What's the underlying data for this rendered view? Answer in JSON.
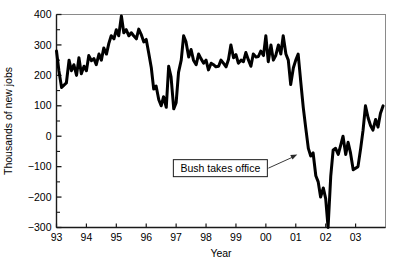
{
  "chart_data": {
    "type": "line",
    "title": "",
    "xlabel": "Year",
    "ylabel": "Thousands of new jobs",
    "xlim": [
      1993.0,
      2004.0
    ],
    "ylim": [
      -300,
      400
    ],
    "grid": false,
    "legend": "none",
    "xtick_labels": [
      "93",
      "94",
      "95",
      "96",
      "97",
      "98",
      "99",
      "00",
      "01",
      "02",
      "03"
    ],
    "xtick_values": [
      1993,
      1994,
      1995,
      1996,
      1997,
      1998,
      1999,
      2000,
      2001,
      2002,
      2003
    ],
    "ytick_labels": [
      "400",
      "300",
      "200",
      "100",
      "0",
      "-100",
      "-200",
      "-300"
    ],
    "ytick_values": [
      400,
      300,
      200,
      100,
      0,
      -100,
      -200,
      -300
    ],
    "yminor_step": 50,
    "line_color": "#000000",
    "line_width": 3,
    "annotations": [
      {
        "text": "Bush takes office",
        "box_x": 2000.05,
        "box_y": -105,
        "arrow_tip_x": 2001.05,
        "arrow_tip_y": -60
      }
    ],
    "series": [
      {
        "name": "Monthly change in nonfarm payroll employment",
        "x": [
          1993.0,
          1993.08,
          1993.17,
          1993.25,
          1993.33,
          1993.42,
          1993.5,
          1993.58,
          1993.67,
          1993.75,
          1993.83,
          1993.92,
          1994.0,
          1994.08,
          1994.17,
          1994.25,
          1994.33,
          1994.42,
          1994.5,
          1994.58,
          1994.67,
          1994.75,
          1994.83,
          1994.92,
          1995.0,
          1995.08,
          1995.17,
          1995.25,
          1995.33,
          1995.42,
          1995.5,
          1995.58,
          1995.67,
          1995.75,
          1995.83,
          1995.92,
          1996.0,
          1996.08,
          1996.17,
          1996.25,
          1996.33,
          1996.42,
          1996.5,
          1996.58,
          1996.67,
          1996.75,
          1996.83,
          1996.92,
          1997.0,
          1997.08,
          1997.17,
          1997.25,
          1997.33,
          1997.42,
          1997.5,
          1997.58,
          1997.67,
          1997.75,
          1997.83,
          1997.92,
          1998.0,
          1998.08,
          1998.17,
          1998.25,
          1998.33,
          1998.42,
          1998.5,
          1998.58,
          1998.67,
          1998.75,
          1998.83,
          1998.92,
          1999.0,
          1999.08,
          1999.17,
          1999.25,
          1999.33,
          1999.42,
          1999.5,
          1999.58,
          1999.67,
          1999.75,
          1999.83,
          1999.92,
          2000.0,
          2000.08,
          2000.17,
          2000.25,
          2000.33,
          2000.42,
          2000.5,
          2000.58,
          2000.67,
          2000.75,
          2000.83,
          2000.92,
          2001.0,
          2001.08,
          2001.17,
          2001.25,
          2001.33,
          2001.42,
          2001.5,
          2001.58,
          2001.67,
          2001.75,
          2001.83,
          2001.92,
          2002.0,
          2002.08,
          2002.17,
          2002.25,
          2002.33,
          2002.42,
          2002.5,
          2002.58,
          2002.67,
          2002.75,
          2002.83,
          2002.92,
          2003.0,
          2003.08,
          2003.17,
          2003.25,
          2003.33,
          2003.42,
          2003.5,
          2003.58,
          2003.67,
          2003.75,
          2003.83,
          2003.92
        ],
        "values": [
          280,
          215,
          160,
          168,
          175,
          250,
          215,
          235,
          200,
          258,
          205,
          230,
          215,
          265,
          248,
          255,
          235,
          270,
          250,
          290,
          270,
          305,
          330,
          320,
          350,
          330,
          395,
          340,
          350,
          330,
          340,
          330,
          320,
          352,
          335,
          310,
          318,
          275,
          225,
          155,
          165,
          120,
          100,
          130,
          95,
          230,
          195,
          90,
          110,
          210,
          250,
          330,
          310,
          260,
          285,
          250,
          235,
          270,
          255,
          240,
          250,
          218,
          240,
          235,
          228,
          230,
          250,
          240,
          228,
          252,
          300,
          258,
          268,
          240,
          250,
          245,
          275,
          250,
          230,
          270,
          260,
          262,
          280,
          265,
          330,
          245,
          300,
          250,
          265,
          300,
          270,
          330,
          270,
          250,
          170,
          225,
          250,
          270,
          175,
          95,
          30,
          -40,
          -65,
          -55,
          -130,
          -150,
          -200,
          -170,
          -205,
          -300,
          -130,
          -45,
          -40,
          -60,
          -30,
          0,
          -60,
          -20,
          -55,
          -110,
          -105,
          -100,
          -40,
          20,
          100,
          60,
          35,
          20,
          55,
          30,
          75,
          100
        ]
      }
    ]
  },
  "axis_labels": {
    "y_title": "Thousands of new jobs",
    "x_title": "Year"
  }
}
